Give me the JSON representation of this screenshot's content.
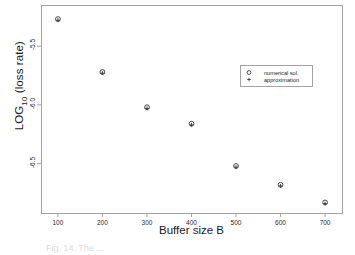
{
  "figure": {
    "background_color": "#ffffff",
    "frame_color": "#9a9a9a",
    "marker_color": "#3d3d3d",
    "caption_partial": "Fig. 14.  The ..."
  },
  "chart_data": {
    "type": "scatter",
    "title": "",
    "xlabel": "Buffer size B",
    "ylabel": "LOG10 (loss rate)",
    "ylabel_base": "LOG",
    "ylabel_sub": "10",
    "ylabel_rest": " (loss rate)",
    "x": [
      100,
      200,
      300,
      400,
      500,
      600,
      700
    ],
    "xlim": [
      62,
      738
    ],
    "ylim": [
      -6.92,
      -5.15
    ],
    "xticks": [
      100,
      200,
      300,
      400,
      500,
      600,
      700
    ],
    "xtick_labels": [
      "100",
      "200",
      "300",
      "400",
      "500",
      "600",
      "700"
    ],
    "yticks": [
      -5.5,
      -6.0,
      -6.5
    ],
    "ytick_labels": [
      "-5.5",
      "-6.0",
      "-6.5"
    ],
    "grid": false,
    "legend_position": "upper right",
    "series": [
      {
        "name": "numerical sol.",
        "marker": "circle",
        "values": [
          -5.27,
          -5.72,
          -6.02,
          -6.16,
          -6.52,
          -6.68,
          -6.83
        ]
      },
      {
        "name": "approximation",
        "marker": "plus",
        "values": [
          -5.28,
          -5.73,
          -6.03,
          -6.17,
          -6.53,
          -6.69,
          -6.84
        ]
      }
    ]
  },
  "legend": {
    "entries": [
      {
        "label": "numerical sol.",
        "marker": "circle"
      },
      {
        "label": "approximation",
        "marker": "plus"
      }
    ]
  }
}
